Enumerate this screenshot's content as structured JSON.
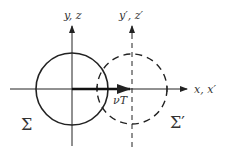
{
  "diagram": {
    "labels": {
      "y_axis": "y, z",
      "y_prime_axis": "y′, z′",
      "x_axis": "x, x′",
      "displacement": "νT",
      "frame_sigma": "Σ",
      "frame_sigma_prime": "Σ′"
    },
    "colors": {
      "stroke": "#222222",
      "text": "#333333",
      "background": "#ffffff"
    },
    "elements": {
      "circle_sigma": {
        "style": "solid",
        "cx": 72,
        "cy": 89,
        "r": 36
      },
      "circle_sigma_prime": {
        "style": "dashed",
        "cx": 132,
        "cy": 89,
        "r": 35
      },
      "displacement_arrow": {
        "from": [
          72,
          89
        ],
        "to": [
          130,
          89
        ]
      }
    }
  }
}
